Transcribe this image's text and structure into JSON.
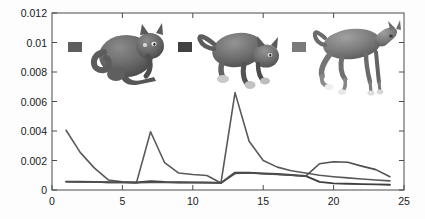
{
  "figure": {
    "background_color": "#fdfdfd",
    "axis_color": "#4a4a4a",
    "text_color": "#1a1a1a"
  },
  "chart_data": {
    "type": "line",
    "title": "",
    "xlabel": "",
    "ylabel": "",
    "xlim": [
      0,
      25
    ],
    "ylim": [
      0,
      0.012
    ],
    "grid": false,
    "legend_position": "inside-top",
    "x_ticks": [
      0,
      5,
      10,
      15,
      20,
      25
    ],
    "x_tick_labels": [
      "0",
      "5",
      "10",
      "15",
      "20",
      "25"
    ],
    "y_ticks": [
      0,
      0.002,
      0.004,
      0.006,
      0.008,
      0.01,
      0.012
    ],
    "y_tick_labels": [
      "0",
      "0.002",
      "0.004",
      "0.006",
      "0.008",
      "0.01",
      "0.012"
    ],
    "x": [
      1,
      2,
      3,
      4,
      5,
      6,
      7,
      8,
      9,
      10,
      11,
      12,
      13,
      14,
      15,
      16,
      17,
      18,
      19,
      20,
      21,
      22,
      23,
      24
    ],
    "series": [
      {
        "name": "cat-sitting",
        "color": "#595959",
        "width": 1.6,
        "values": [
          0.00405,
          0.00255,
          0.0015,
          0.00068,
          0.00055,
          0.0005,
          0.00395,
          0.00185,
          0.00115,
          0.00105,
          0.00098,
          0.00048,
          0.0066,
          0.0033,
          0.002,
          0.00155,
          0.0013,
          0.00115,
          0.001,
          0.0009,
          0.00082,
          0.00075,
          0.00068,
          0.00062
        ]
      },
      {
        "name": "cat-prowling",
        "color": "#3f3f3f",
        "width": 1.9,
        "values": [
          0.00057,
          0.00056,
          0.00055,
          0.00053,
          0.00052,
          0.00051,
          0.0006,
          0.00055,
          0.00053,
          0.00052,
          0.00051,
          0.00048,
          0.00118,
          0.00118,
          0.00112,
          0.00108,
          0.00102,
          0.00095,
          0.00055,
          0.00045,
          0.00042,
          0.0004,
          0.00038,
          0.00036
        ]
      },
      {
        "name": "horse-trotting",
        "color": "#4f4f4f",
        "width": 1.6,
        "values": [
          0.00056,
          0.00055,
          0.00054,
          0.00052,
          0.00051,
          0.0005,
          0.00052,
          0.00051,
          0.0005,
          0.0005,
          0.00049,
          0.00047,
          0.00112,
          0.00115,
          0.0011,
          0.00106,
          0.001,
          0.00093,
          0.00178,
          0.00192,
          0.00188,
          0.00162,
          0.00138,
          0.0009
        ]
      }
    ]
  },
  "legend": {
    "entries": [
      {
        "name": "swatch-cat-sitting",
        "color": "#5e5e5e",
        "label": ""
      },
      {
        "name": "swatch-cat-prowling",
        "color": "#414141",
        "label": ""
      },
      {
        "name": "swatch-horse-trotting",
        "color": "#7a7a7a",
        "label": ""
      }
    ]
  },
  "thumbnails": [
    {
      "name": "cat-sitting-render",
      "caption": "cat sitting 3D mesh"
    },
    {
      "name": "cat-prowling-render",
      "caption": "cat prowling 3D mesh"
    },
    {
      "name": "horse-trotting-render",
      "caption": "horse trotting 3D mesh"
    }
  ]
}
